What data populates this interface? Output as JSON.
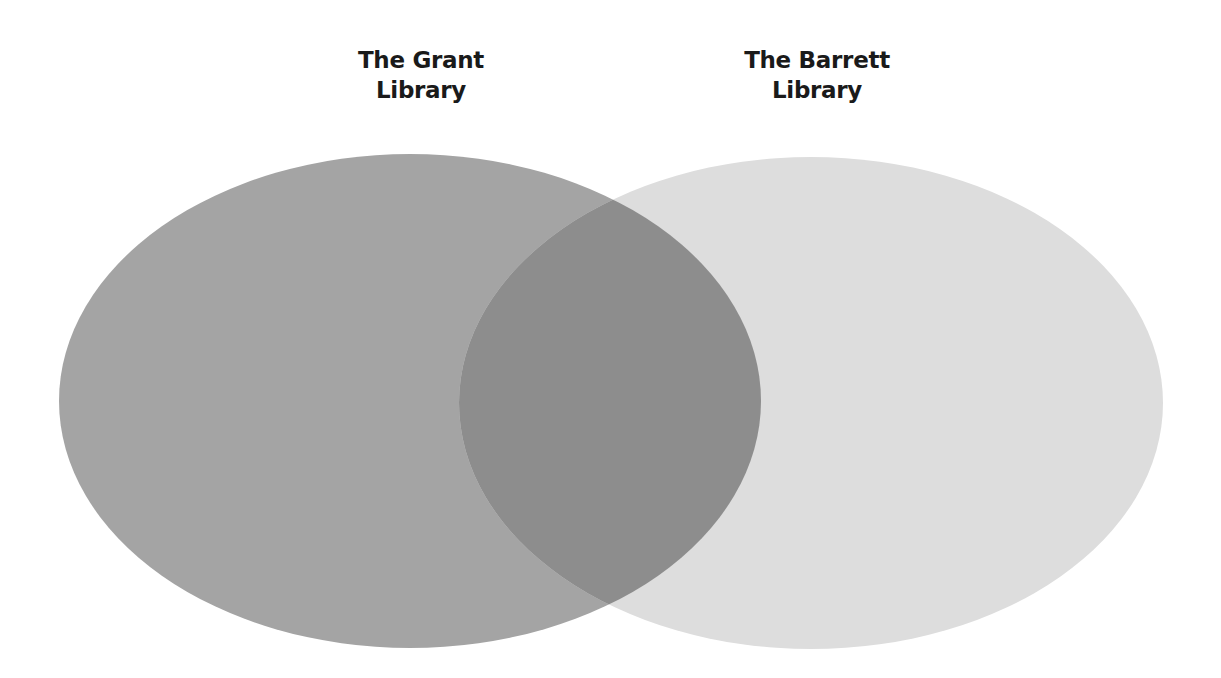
{
  "diagram": {
    "type": "venn",
    "sets": [
      {
        "id": "grant",
        "label_line1": "The Grant",
        "label_line2": "Library",
        "color": "#a4a4a4"
      },
      {
        "id": "barrett",
        "label_line1": "The Barrett",
        "label_line2": "Library",
        "color": "#dddddd"
      }
    ],
    "intersection": {
      "color": "#8d8d8d"
    }
  }
}
